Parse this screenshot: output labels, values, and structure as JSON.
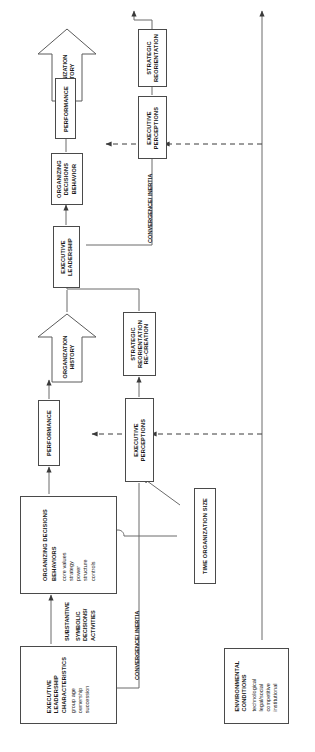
{
  "diagram": {
    "orientation": "text rotated 90 degrees counter-clockwise",
    "colors": {
      "stroke": "#4a4a4a",
      "text": "#1a1a1a",
      "background": "#ffffff"
    }
  },
  "nodes": {
    "exec_leadership_char": {
      "title": "EXECUTIVE\nLEADERSHIP\nCHARACTERISTICS",
      "lines": [
        "EXECUTIVE",
        "LEADERSHIP",
        "CHARACTERISTICS"
      ],
      "items": [
        "group age",
        "ownership",
        "succession"
      ]
    },
    "organizing_decisions": {
      "lines": [
        "ORGANIZING DECISIONS",
        "BEHAVIORS"
      ],
      "items": [
        "core values",
        "strategy",
        "power",
        "structure",
        "controls"
      ]
    },
    "environmental_conditions": {
      "lines": [
        "ENVIRONMENTAL",
        "CONDITIONS"
      ],
      "items": [
        "technological",
        "legal/social",
        "competitive",
        "institutional"
      ]
    },
    "time_org_size": {
      "label": "TIME  ORGANIZATION SIZE"
    },
    "performance_lower": {
      "label": "PERFORMANCE"
    },
    "exec_perceptions_lower": {
      "lines": [
        "EXECUTIVE",
        "PERCEPTIONS"
      ]
    },
    "org_history_lower": {
      "lines": [
        "ORGANIZATION",
        "HISTORY"
      ]
    },
    "strategic_reorientation_recreation": {
      "lines": [
        "STRATEGIC",
        "REORIENTATION",
        "RE-CREATION"
      ]
    },
    "exec_leadership_upper": {
      "lines": [
        "EXECUTIVE",
        "LEADERSHIP"
      ]
    },
    "organizing_decisions_behavior": {
      "lines": [
        "ORGANIZING",
        "DECISIONS",
        "BEHAVIOR"
      ]
    },
    "performance_upper": {
      "label": "PERFORMANCE"
    },
    "exec_perceptions_upper": {
      "lines": [
        "EXECUTIVE",
        "PERCEPTIONS"
      ]
    },
    "org_history_upper": {
      "lines": [
        "ORGANIZATION",
        "HISTORY"
      ]
    },
    "strategic_reorientation_upper": {
      "lines": [
        "STRATEGIC",
        "REORIENTATION"
      ]
    }
  },
  "captions": {
    "substantive": "SUBSTANTIVE",
    "symbolic": "SYMBOLIC\nDECISIONS/\nACTIVITIES",
    "symbolic_lines": [
      "SYMBOLIC",
      "DECISIONS/",
      "ACTIVITIES"
    ],
    "convergence_lower": "CONVERGENCE/ INERTIA",
    "convergence_upper": "CONVERGENCE/ INERTIA"
  }
}
